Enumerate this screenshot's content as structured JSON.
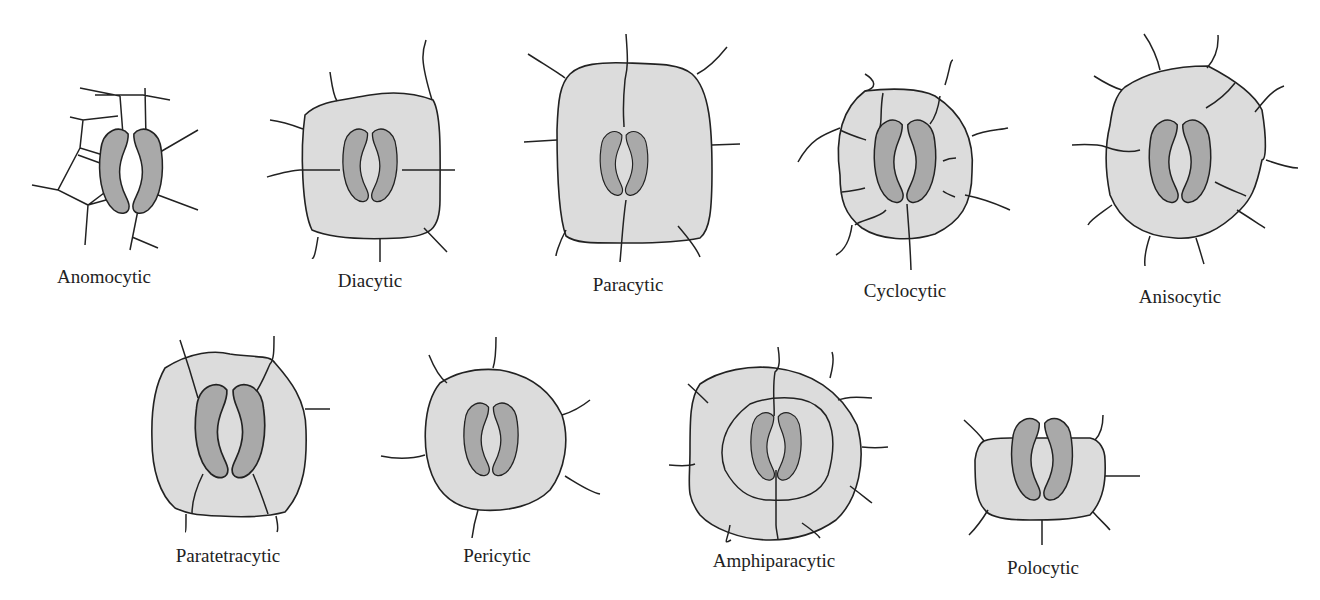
{
  "diagram": {
    "types": [
      {
        "id": "anomocytic",
        "label": "Anomocytic",
        "row": 1
      },
      {
        "id": "diacytic",
        "label": "Diacytic",
        "row": 1
      },
      {
        "id": "paracytic",
        "label": "Paracytic",
        "row": 1
      },
      {
        "id": "cyclocytic",
        "label": "Cyclocytic",
        "row": 1
      },
      {
        "id": "anisocytic",
        "label": "Anisocytic",
        "row": 1
      },
      {
        "id": "paratetracytic",
        "label": "Paratetracytic",
        "row": 2
      },
      {
        "id": "pericytic",
        "label": "Pericytic",
        "row": 2
      },
      {
        "id": "amphiparacytic",
        "label": "Amphiparacytic",
        "row": 2
      },
      {
        "id": "polocytic",
        "label": "Polocytic",
        "row": 2
      }
    ],
    "colors": {
      "guard_cell": "#a9a9a9",
      "subsidiary_cell": "#dcdcdc",
      "outline": "#222222",
      "background": "#ffffff"
    }
  }
}
